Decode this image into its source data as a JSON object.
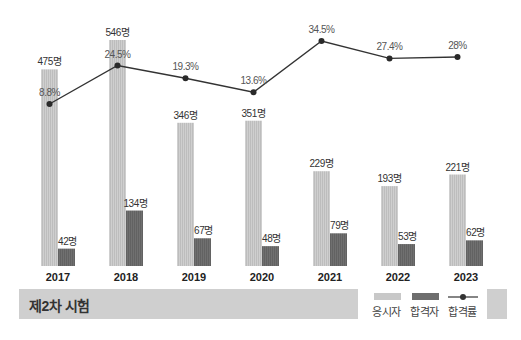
{
  "chart_data": {
    "type": "bar+line",
    "title": "제2차 시험",
    "categories": [
      "2017",
      "2018",
      "2019",
      "2020",
      "2021",
      "2022",
      "2023"
    ],
    "series": [
      {
        "name": "응시자",
        "type": "bar",
        "color": "#c8c8c8",
        "values": [
          475,
          546,
          346,
          351,
          229,
          193,
          221
        ],
        "labels": [
          "475명",
          "546명",
          "346명",
          "351명",
          "229명",
          "193명",
          "221명"
        ]
      },
      {
        "name": "합격자",
        "type": "bar",
        "color": "#6e6e6e",
        "values": [
          42,
          134,
          67,
          48,
          79,
          53,
          62
        ],
        "labels": [
          "42명",
          "134명",
          "67명",
          "48명",
          "79명",
          "53명",
          "62명"
        ]
      },
      {
        "name": "합격률",
        "type": "line",
        "color": "#333333",
        "values": [
          8.8,
          24.5,
          19.3,
          13.6,
          34.5,
          27.4,
          28
        ],
        "labels": [
          "8.8%",
          "24.5%",
          "19.3%",
          "13.6%",
          "34.5%",
          "27.4%",
          "28%"
        ]
      }
    ],
    "xlabel": "",
    "ylabel": "",
    "grid": false,
    "legend_position": "bottom-right"
  },
  "band": {
    "title": "제2차 시험"
  },
  "legend": {
    "applicants": "응시자",
    "passers": "합격자",
    "pass_rate": "합격률"
  },
  "colors": {
    "applicants": "#c8c8c8",
    "passers": "#6e6e6e",
    "line": "#333333",
    "band": "#cfcfcf"
  }
}
